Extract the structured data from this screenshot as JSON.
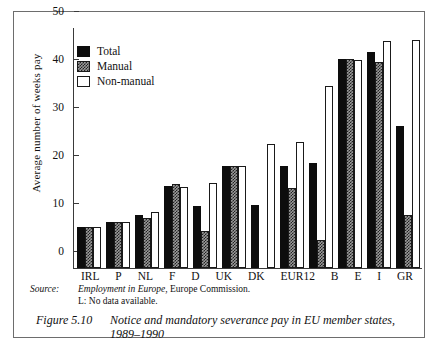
{
  "figure": {
    "number_label": "Figure 5.10",
    "caption": "Notice and mandatory severance pay in EU member states, 1989–1990",
    "source_key": "Source:",
    "source_value_italic": "Employment in Europe",
    "source_value_rest": ", Europe Commission.",
    "note": "L: No data available."
  },
  "legend": {
    "items": [
      {
        "label": "Total",
        "key": "total",
        "color": "#0d0d0d"
      },
      {
        "label": "Manual",
        "key": "manual",
        "color": "#9a9a9a"
      },
      {
        "label": "Non-manual",
        "key": "nonmanual",
        "color": "#ffffff"
      }
    ]
  },
  "chart_data": {
    "type": "bar",
    "title": "",
    "xlabel": "",
    "ylabel": "Average number of weeks pay",
    "ylim": [
      0,
      50
    ],
    "yticks": [
      0,
      10,
      20,
      30,
      40,
      50
    ],
    "grid": false,
    "legend_position": "upper-left-inside",
    "categories": [
      "IRL",
      "P",
      "NL",
      "F",
      "D",
      "UK",
      "DK",
      "EUR12",
      "B",
      "E",
      "I",
      "GR"
    ],
    "series": [
      {
        "name": "Total",
        "values": [
          8.5,
          9.5,
          11.0,
          17.0,
          13.0,
          21.3,
          13.1,
          21.2,
          21.8,
          43.5,
          45.0,
          29.5
        ]
      },
      {
        "name": "Manual",
        "values": [
          8.5,
          9.5,
          10.4,
          17.5,
          7.8,
          21.3,
          null,
          16.6,
          5.8,
          43.5,
          43.0,
          11.0
        ]
      },
      {
        "name": "Non-manual",
        "values": [
          8.5,
          9.5,
          11.7,
          16.8,
          17.7,
          21.2,
          25.8,
          26.2,
          38.0,
          43.4,
          47.2,
          47.6
        ]
      }
    ]
  }
}
